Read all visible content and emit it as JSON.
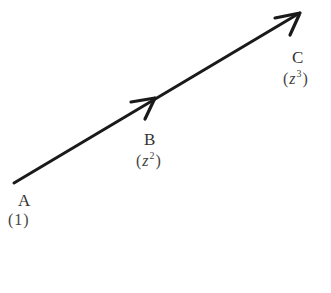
{
  "diagram": {
    "type": "vector-path",
    "stroke_color": "#1a1a1a",
    "points": [
      {
        "name": "A",
        "value_base": "1",
        "value_exp": "",
        "x": 14,
        "y": 183
      },
      {
        "name": "B",
        "value_base": "z",
        "value_exp": "2",
        "x": 155,
        "y": 98
      },
      {
        "name": "C",
        "value_base": "z",
        "value_exp": "3",
        "x": 300,
        "y": 13
      }
    ],
    "arrows": [
      {
        "from": "A",
        "to": "B"
      },
      {
        "from": "B",
        "to": "C"
      }
    ]
  }
}
